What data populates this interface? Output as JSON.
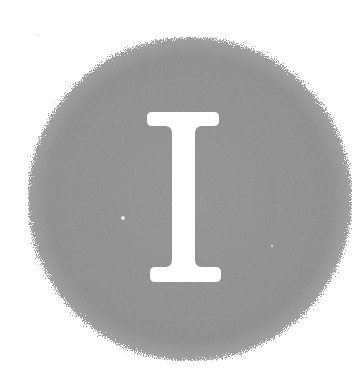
{
  "illustration": {
    "letter": "I",
    "style": "drop-cap",
    "disc_color": "#8a8a8a",
    "letter_color": "#ffffff",
    "background": "#ffffff"
  }
}
